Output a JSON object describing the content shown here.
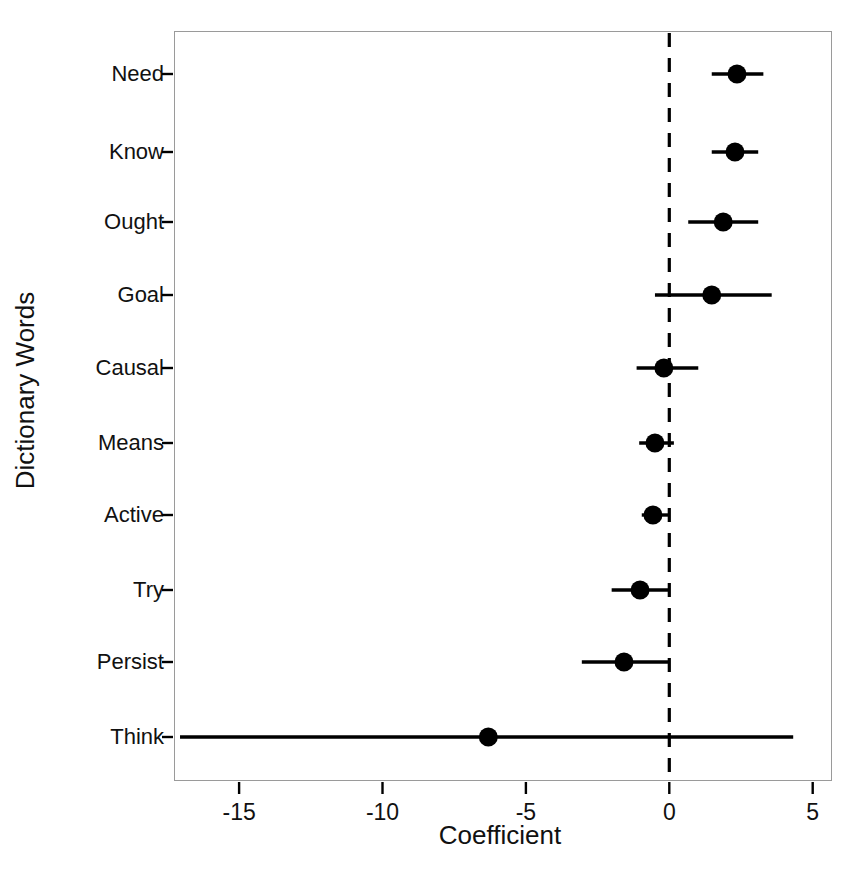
{
  "figure": {
    "background_color": "#ffffff",
    "foreground_color": "#000000",
    "frame_color": "#9a9a9a"
  },
  "axis": {
    "xlabel": "Coefficient",
    "ylabel": "Dictionary Words",
    "xticks": [
      "-15",
      "-10",
      "-5",
      "0",
      "5"
    ],
    "xtick_values": [
      -15,
      -10,
      -5,
      0,
      5
    ],
    "xlim": [
      -17.9,
      5.7
    ],
    "reference_line_value": "0"
  },
  "chart_data": {
    "type": "scatter",
    "subtype": "coefficient-forest-plot",
    "title": "",
    "xlabel": "Coefficient",
    "ylabel": "Dictionary Words",
    "xlim": [
      -17.9,
      5.7
    ],
    "xticks": [
      -15,
      -10,
      -5,
      0,
      5
    ],
    "grid": false,
    "legend": "none",
    "reference_line": 0,
    "reference_line_style": "dashed",
    "orientation": "horizontal",
    "categories": [
      "Need",
      "Know",
      "Ought",
      "Goal",
      "Causal",
      "Means",
      "Active",
      "Try",
      "Persist",
      "Think"
    ],
    "values": [
      2.36,
      2.29,
      1.88,
      1.48,
      -0.19,
      -0.5,
      -0.57,
      -1.02,
      -1.58,
      -6.31
    ],
    "ci_low": [
      1.48,
      1.48,
      0.66,
      -0.5,
      -1.14,
      -1.05,
      -0.96,
      -2.01,
      -3.05,
      -17.06
    ],
    "ci_high": [
      3.28,
      3.1,
      3.1,
      3.57,
      1.01,
      0.16,
      -0.03,
      0.02,
      0.02,
      4.32
    ],
    "points": [
      {
        "label": "Need",
        "value": 2.36,
        "low": 1.48,
        "high": 3.28
      },
      {
        "label": "Know",
        "value": 2.29,
        "low": 1.48,
        "high": 3.1
      },
      {
        "label": "Ought",
        "value": 1.88,
        "low": 0.66,
        "high": 3.1
      },
      {
        "label": "Goal",
        "value": 1.48,
        "low": -0.5,
        "high": 3.57
      },
      {
        "label": "Causal",
        "value": -0.19,
        "low": -1.14,
        "high": 1.01
      },
      {
        "label": "Means",
        "value": -0.5,
        "low": -1.05,
        "high": 0.16
      },
      {
        "label": "Active",
        "value": -0.57,
        "low": -0.96,
        "high": -0.03
      },
      {
        "label": "Try",
        "value": -1.02,
        "low": -2.01,
        "high": 0.02
      },
      {
        "label": "Persist",
        "value": -1.58,
        "low": -3.05,
        "high": 0.02
      },
      {
        "label": "Think",
        "value": -6.31,
        "low": -17.06,
        "high": 4.32
      }
    ]
  }
}
